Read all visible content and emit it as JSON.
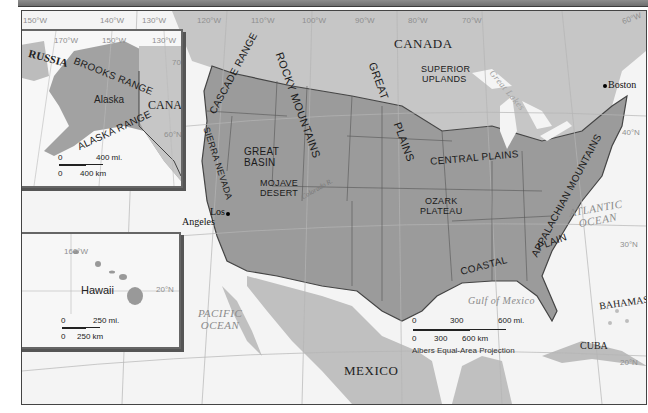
{
  "map": {
    "colors": {
      "land_us": "#9a9a9a",
      "land_other": "#c4c4c4",
      "water": "#f4f4f4",
      "border": "#444444",
      "grid": "#b8b8b8"
    },
    "longitude_labels": [
      "150°W",
      "140°W",
      "130°W",
      "120°W",
      "110°W",
      "100°W",
      "90°W",
      "80°W",
      "70°W",
      "60°W"
    ],
    "latitude_labels": {
      "n40": "40°N",
      "n30": "30°N",
      "n20": "20°N"
    },
    "countries": {
      "canada": "CANADA",
      "mexico": "MEXICO",
      "cuba": "CUBA",
      "bahamas": "BAHAMAS"
    },
    "water_bodies": {
      "pacific": "PACIFIC\nOCEAN",
      "atlantic": "ATLANTIC\nOCEAN",
      "gulf": "Gulf of Mexico",
      "great_lakes": "Great Lakes"
    },
    "regions": {
      "cascade": "CASCADE RANGE",
      "rocky": "ROCKY MOUNTAINS",
      "great_plains_1": "GREAT",
      "great_plains_2": "PLAINS",
      "superior_1": "SUPERIOR",
      "superior_2": "UPLANDS",
      "sierra": "SIERRA NEVADA",
      "great_basin_1": "GREAT",
      "great_basin_2": "BASIN",
      "mojave_1": "MOJAVE",
      "mojave_2": "DESERT",
      "central_plains": "CENTRAL PLAINS",
      "ozark_1": "OZARK",
      "ozark_2": "PLATEAU",
      "appalachian": "APPALACHIAN MOUNTAINS",
      "coastal": "COASTAL",
      "plain": "PLAIN",
      "colorado_river": "Colorado R."
    },
    "cities": {
      "boston": "Boston",
      "los_angeles_1": "Los",
      "los_angeles_2": "Angeles"
    },
    "scale": {
      "mi0": "0",
      "mi300": "300",
      "mi600": "600 mi.",
      "km0": "0",
      "km300": "300",
      "km600": "600 km"
    },
    "projection": "Albers Equal-Area Projection"
  },
  "alaska_inset": {
    "grid": [
      "170°W",
      "150°W",
      "130°W"
    ],
    "lat": "60°N",
    "lat2": "70°N",
    "labels": {
      "russia": "RUSSIA",
      "brooks": "BROOKS RANGE",
      "alaska": "Alaska",
      "canada": "CANADA",
      "alaska_range": "ALASKA RANGE"
    },
    "scale": {
      "mi0": "0",
      "mi": "400 mi.",
      "km0": "0",
      "km": "400 km"
    }
  },
  "hawaii_inset": {
    "grid_lon": "160°W",
    "grid_lat": "20°N",
    "label": "Hawaii",
    "scale": {
      "mi0": "0",
      "mi": "250 mi.",
      "km0": "0",
      "km": "250 km"
    }
  }
}
